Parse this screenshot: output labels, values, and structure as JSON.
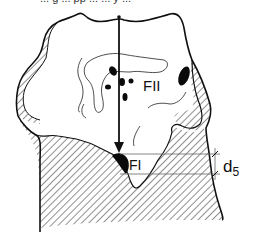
{
  "diagram": {
    "caption_fragment": "... g  ... pp ... ... y ...",
    "labels": {
      "fusion_zone_2": "FII",
      "fusion_zone_1": "FI",
      "dimension": "d",
      "dimension_subscript": "5"
    },
    "colors": {
      "line": "#111111",
      "hatch": "#333333",
      "fill_black": "#0a0a0a",
      "background": "#ffffff"
    },
    "elements": [
      "outer contour",
      "hatched cross-section region",
      "vertical arrow",
      "black inclusion spots",
      "thin inner contour lines",
      "dimension lines d5"
    ]
  }
}
